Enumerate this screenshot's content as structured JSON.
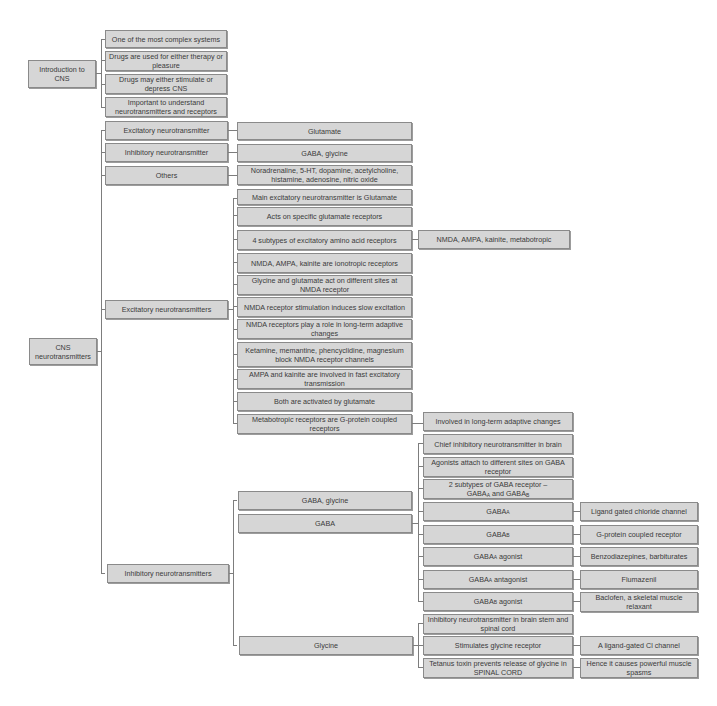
{
  "intro": {
    "root": "Introduction to CNS",
    "items": [
      "One of the most complex systems",
      "Drugs are used for either therapy or pleasure",
      "Drugs may either stimulate or depress CNS",
      "Important to understand neurotransmitters and receptors"
    ]
  },
  "cns": {
    "root": "CNS neurotransmitters",
    "categories": [
      {
        "label": "Excitatory neurotransmitter",
        "value": "Glutamate"
      },
      {
        "label": "Inhibitory neurotransmitter",
        "value": "GABA, glycine"
      },
      {
        "label": "Others",
        "value": "Noradrenaline, 5-HT, dopamine, acetylcholine, histamine, adenosine, nitric oxide"
      }
    ],
    "excitatory": {
      "label": "Excitatory neurotransmitters",
      "items": [
        "Main excitatory neurotransmitter is Glutamate",
        "Acts on specific glutamate receptors",
        "4 subtypes of excitatory amino acid receptors",
        "NMDA, AMPA, kainite are ionotropic receptors",
        "Glycine and glutamate act on different sites at NMDA receptor",
        "NMDA receptor stimulation induces slow excitation",
        "NMDA receptors play a role in long-term adaptive changes",
        "Ketamine, memantine, phencyclidine, magnesium block NMDA receptor channels",
        "AMPA and kainite are involved in fast excitatory transmission",
        "Both are activated by glutamate",
        "Metabotropic receptors are G-protein coupled receptors"
      ],
      "subtypes_detail": "NMDA, AMPA, kainite, metabotropic",
      "metabotropic_detail": "Involved in long-term adaptive changes"
    },
    "inhibitory": {
      "label": "Inhibitory neurotransmitters",
      "groups": {
        "gaba_glycine": "GABA, glycine",
        "gaba": "GABA",
        "glycine": "Glycine"
      },
      "gaba_items": {
        "chief": "Chief inhibitory neurotransmitter in brain",
        "agonists": "Agonists attach to different sites on GABA receptor",
        "subtypes_prefix": "2 subtypes of GABA receptor –",
        "subtypes_a": "GABA",
        "subtypes_a_sub": "A",
        "subtypes_and": " and GABA",
        "subtypes_b_sub": "B",
        "gaba_a": "GABA",
        "gaba_a_sub": "A",
        "gaba_b": "GABA",
        "gaba_b_sub": "B",
        "gaba_a_agonist": "GABA",
        "gaba_a_agonist_sub": "A",
        "gaba_a_agonist_suffix": " agonist",
        "gaba_a_antagonist": "GABA",
        "gaba_a_antagonist_sub": "A",
        "gaba_a_antagonist_suffix": " antagonist",
        "gaba_b_agonist": "GABA",
        "gaba_b_agonist_sub": "B",
        "gaba_b_agonist_suffix": " agonist"
      },
      "gaba_details": {
        "gaba_a": "Ligand gated chloride channel",
        "gaba_b": "G-protein coupled receptor",
        "gaba_a_agonist": "Benzodiazepines, barbiturates",
        "gaba_a_antagonist": "Flumazenil",
        "gaba_b_agonist": "Baclofen, a skeletal muscle relaxant"
      },
      "glycine_items": [
        "Inhibitory neurotransmitter in brain stem and spinal cord",
        "Stimulates glycine receptor",
        "Tetanus toxin prevents release of glycine in SPINAL CORD"
      ],
      "glycine_details": {
        "receptor": "A ligand-gated Cl channel",
        "tetanus": "Hence it causes powerful muscle spasms"
      }
    }
  },
  "colors": {
    "box_fill": "#d6d6d6",
    "box_border": "#8a8a8a",
    "line": "#7d7d7d",
    "text": "#3a3a3a"
  }
}
